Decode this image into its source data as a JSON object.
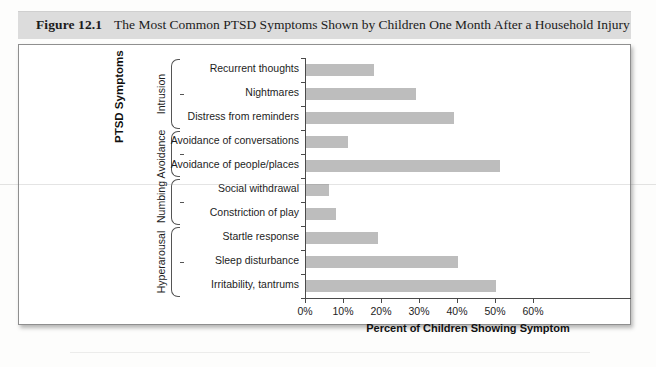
{
  "caption": {
    "label": "Figure 12.1",
    "title": "The Most Common PTSD Symptoms Shown by Children One Month After a Household Injury"
  },
  "chart_data": {
    "type": "bar",
    "orientation": "horizontal",
    "title": "The Most Common PTSD Symptoms Shown by Children One Month After a Household Injury",
    "xlabel": "Percent of Children Showing Symptom",
    "ylabel": "PTSD Symptoms",
    "xlim": [
      0,
      60
    ],
    "xticks": [
      0,
      10,
      20,
      30,
      40,
      50,
      60
    ],
    "xtick_labels": [
      "0%",
      "10%",
      "20%",
      "30%",
      "40%",
      "50%",
      "60%"
    ],
    "grid": false,
    "legend": false,
    "bar_color": "#bdbdbd",
    "categories": [
      "Recurrent thoughts",
      "Nightmares",
      "Distress from reminders",
      "Avoidance of conversations",
      "Avoidance of people/places",
      "Social withdrawal",
      "Constriction of play",
      "Startle response",
      "Sleep disturbance",
      "Irritability, tantrums"
    ],
    "values": [
      18,
      29,
      39,
      11,
      51,
      6,
      8,
      19,
      40,
      50
    ],
    "groups": [
      {
        "name": "Intrusion",
        "categories": [
          "Recurrent thoughts",
          "Nightmares",
          "Distress from reminders"
        ]
      },
      {
        "name": "Avoidance",
        "categories": [
          "Avoidance of conversations",
          "Avoidance of people/places"
        ]
      },
      {
        "name": "Numbing",
        "categories": [
          "Social withdrawal",
          "Constriction of play"
        ]
      },
      {
        "name": "Hyperarousal",
        "categories": [
          "Startle response",
          "Sleep disturbance",
          "Irritability, tantrums"
        ]
      }
    ]
  },
  "bars": [
    {
      "label": "Recurrent thoughts",
      "value": 18
    },
    {
      "label": "Nightmares",
      "value": 29
    },
    {
      "label": "Distress from reminders",
      "value": 39
    },
    {
      "label": "Avoidance of conversations",
      "value": 11
    },
    {
      "label": "Avoidance of people/places",
      "value": 51
    },
    {
      "label": "Social withdrawal",
      "value": 6
    },
    {
      "label": "Constriction of play",
      "value": 8
    },
    {
      "label": "Startle response",
      "value": 19
    },
    {
      "label": "Sleep disturbance",
      "value": 40
    },
    {
      "label": "Irritability, tantrums",
      "value": 50
    }
  ],
  "xticks": [
    {
      "value": 0,
      "label": "0%"
    },
    {
      "value": 10,
      "label": "10%"
    },
    {
      "value": 20,
      "label": "20%"
    },
    {
      "value": 30,
      "label": "30%"
    },
    {
      "value": 40,
      "label": "40%"
    },
    {
      "value": 50,
      "label": "50%"
    },
    {
      "value": 60,
      "label": "60%"
    }
  ],
  "groups": [
    {
      "name": "Intrusion"
    },
    {
      "name": "Avoidance"
    },
    {
      "name": "Numbing"
    },
    {
      "name": "Hyperarousal"
    }
  ],
  "axis_titles": {
    "x": "Percent of Children Showing Symptom",
    "y": "PTSD Symptoms"
  }
}
